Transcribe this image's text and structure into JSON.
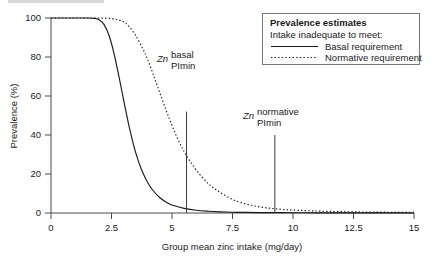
{
  "chart_data": {
    "type": "line",
    "title": "",
    "xlabel": "Group mean zinc intake (mg/day)",
    "ylabel": "Prevalence (%)",
    "xlim": [
      0,
      15
    ],
    "ylim": [
      0,
      100
    ],
    "xticks": [
      "0",
      "2.5",
      "5",
      "7.5",
      "10",
      "12.5",
      "15"
    ],
    "xtick_values": [
      0,
      2.5,
      5,
      7.5,
      10,
      12.5,
      15
    ],
    "yticks": [
      "0",
      "20",
      "40",
      "60",
      "80",
      "100"
    ],
    "ytick_values": [
      0,
      20,
      40,
      60,
      80,
      100
    ],
    "grid": false,
    "legend_position": "top-right",
    "series": [
      {
        "name": "Basal requirement",
        "style": "solid",
        "color": "#1a1a1a",
        "x": [
          0,
          0.5,
          1.0,
          1.5,
          1.8,
          2.0,
          2.2,
          2.4,
          2.6,
          2.8,
          3.0,
          3.2,
          3.4,
          3.6,
          3.8,
          4.0,
          4.2,
          4.5,
          4.8,
          5.1,
          5.5,
          6.0,
          6.5,
          7.0,
          7.5,
          8.0,
          9.0,
          10.0,
          11.0,
          12.0,
          13.0,
          14.0,
          15.0
        ],
        "values": [
          100,
          100,
          100,
          100,
          99.8,
          99.0,
          96.5,
          91.0,
          82.0,
          70.5,
          58.0,
          46.0,
          35.5,
          27.0,
          20.5,
          15.5,
          11.8,
          7.8,
          5.3,
          3.7,
          2.4,
          1.4,
          0.9,
          0.6,
          0.4,
          0.3,
          0.2,
          0.15,
          0.1,
          0.1,
          0.05,
          0.05,
          0.0
        ]
      },
      {
        "name": "Normative requirement",
        "style": "dotted",
        "color": "#1a1a1a",
        "x": [
          0,
          0.5,
          1.0,
          1.5,
          2.0,
          2.5,
          2.8,
          3.0,
          3.2,
          3.5,
          3.8,
          4.0,
          4.3,
          4.6,
          4.9,
          5.2,
          5.5,
          5.8,
          6.2,
          6.6,
          7.0,
          7.5,
          8.0,
          8.5,
          9.0,
          9.5,
          10.0,
          11.0,
          12.0,
          13.0,
          14.0,
          15.0
        ],
        "values": [
          100,
          100,
          100,
          100,
          100,
          99.7,
          99.0,
          98.0,
          96.0,
          91.0,
          84.0,
          78.5,
          68.5,
          58.0,
          48.0,
          39.0,
          31.5,
          25.5,
          19.0,
          14.0,
          10.5,
          7.0,
          4.8,
          3.4,
          2.5,
          1.9,
          1.5,
          1.0,
          0.7,
          0.5,
          0.4,
          0.3
        ]
      }
    ],
    "annotations": [
      {
        "id": "zn-basal-plmin",
        "italic_label": "Zn",
        "line1": "basal",
        "line2": "PImin",
        "x_value": 5.6,
        "y_top": 52,
        "y_bottom": 0
      },
      {
        "id": "zn-normative-plmin",
        "italic_label": "Zn",
        "line1": "normative",
        "line2": "PImin",
        "x_value": 9.25,
        "y_top": 40,
        "y_bottom": 0
      }
    ]
  },
  "legend": {
    "title": "Prevalence estimates",
    "subtitle": "Intake inadequate to meet:",
    "entries": [
      {
        "label": "Basal requirement",
        "style": "solid"
      },
      {
        "label": "Normative requirement",
        "style": "dotted"
      }
    ]
  }
}
